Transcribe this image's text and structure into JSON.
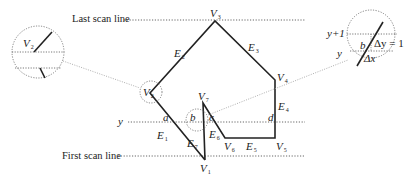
{
  "figure": {
    "scan_lines": {
      "last_label": "Last scan line",
      "first_label": "First scan line",
      "y_label": "y"
    },
    "vertices": [
      {
        "name": "V",
        "sub": "1"
      },
      {
        "name": "V",
        "sub": "2"
      },
      {
        "name": "V",
        "sub": "3"
      },
      {
        "name": "V",
        "sub": "4"
      },
      {
        "name": "V",
        "sub": "5"
      },
      {
        "name": "V",
        "sub": "6"
      },
      {
        "name": "V",
        "sub": "7"
      }
    ],
    "edges": [
      {
        "name": "E",
        "sub": "1"
      },
      {
        "name": "E",
        "sub": "2"
      },
      {
        "name": "E",
        "sub": "3"
      },
      {
        "name": "E",
        "sub": "4"
      },
      {
        "name": "E",
        "sub": "5"
      },
      {
        "name": "E",
        "sub": "6"
      },
      {
        "name": "E",
        "sub": "7"
      }
    ],
    "intersections": [
      "a",
      "b",
      "c",
      "d"
    ],
    "left_inset": {
      "vertex": "V",
      "vertex_sub": "2"
    },
    "right_inset": {
      "y_plus_1": "y+1",
      "y": "y",
      "b": "b",
      "delta_y": "Δy = 1",
      "delta_x": "Δx"
    },
    "colors": {
      "line": "#222222",
      "dotted": "#555555",
      "leader": "#999999"
    }
  }
}
